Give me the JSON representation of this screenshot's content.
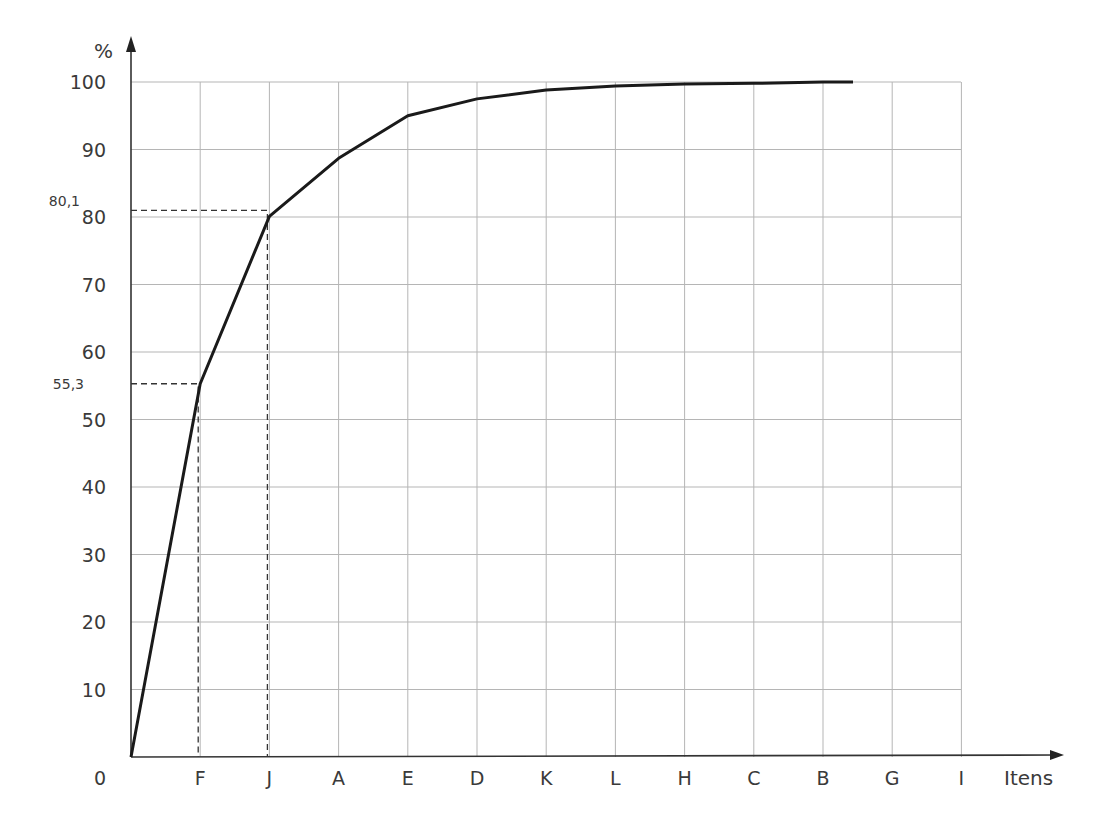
{
  "chart_data": {
    "type": "line",
    "title": "",
    "xlabel": "Itens",
    "ylabel": "%",
    "ylim": [
      0,
      100
    ],
    "yticks": [
      0,
      10,
      20,
      30,
      40,
      50,
      60,
      70,
      80,
      90,
      100
    ],
    "categories": [
      "F",
      "J",
      "A",
      "E",
      "D",
      "K",
      "L",
      "H",
      "C",
      "B",
      "G",
      "I"
    ],
    "grid": true,
    "legend": null,
    "series": [
      {
        "name": "Cumulative %",
        "x": [
          "0",
          "F",
          "J",
          "A",
          "E",
          "D",
          "K",
          "L",
          "H",
          "C",
          "B",
          "end"
        ],
        "values": [
          0,
          55.3,
          80.1,
          88.7,
          95.0,
          97.5,
          98.8,
          99.4,
          99.7,
          99.8,
          100.0,
          100.0
        ]
      }
    ],
    "annotations": [
      {
        "label": "55,3",
        "x": "F",
        "y": 55.3
      },
      {
        "label": "80,1",
        "x": "J",
        "y": 80.1
      }
    ],
    "origin_label": "0"
  }
}
